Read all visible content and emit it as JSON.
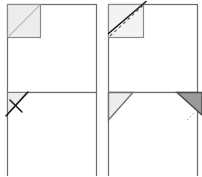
{
  "figure": {
    "layout": "2x2 grid of four line diagrams",
    "canvas": {
      "width": 202,
      "height": 176
    },
    "colors": {
      "sheet_outline": "#6b6b6b",
      "sheet_outline_dark": "#4a4a4a",
      "fold_line_solid": "#1a1a1a",
      "fold_line_dashed": "#555555",
      "shade_light": "#ededed",
      "shade_mid": "#d9d9d9",
      "shade_dark": "#8f8f8f",
      "background": "#ffffff"
    },
    "panels": [
      {
        "id": "panel-1",
        "label": "Step 1",
        "description": "Large sheet with a small shaded square marked in the top-left corner and a faint diagonal crease running corner to corner inside it.",
        "sheet": {
          "x": 7,
          "y": 4,
          "width": 89,
          "height": 88
        },
        "corner_square": {
          "x": 7,
          "y": 4,
          "size": 33,
          "fill": "#ededed",
          "stroke": "#8a8a8a"
        },
        "crease": {
          "type": "diagonal",
          "from": "bottom-left",
          "to": "top-right",
          "style": "solid-faint",
          "color": "#b9b9b9"
        }
      },
      {
        "id": "panel-2",
        "label": "Step 2",
        "description": "Same sheet; the corner square now shows a dashed diagonal crease plus a bold solid fold line lifting from the lower-left of the square past the top-right corner.",
        "sheet": {
          "x": 7,
          "y": 4,
          "width": 89,
          "height": 88
        },
        "corner_square": {
          "x": 7,
          "y": 4,
          "size": 35,
          "fill": "#f3f3f3",
          "stroke": "#8a8a8a"
        },
        "crease_dashed": {
          "from": "bottom-left",
          "to": "top-right",
          "style": "dashed",
          "color": "#5a5a5a",
          "dash": "3 3"
        },
        "fold_solid": {
          "from": "bottom-left",
          "to": "beyond-top-right",
          "style": "solid",
          "color": "#1a1a1a",
          "width": 1.6
        }
      },
      {
        "id": "panel-3",
        "label": "Step 3",
        "description": "Sheet with the top-left corner folded over into a shaded triangle; a short solid stroke crosses the triangle indicating the flap being turned.",
        "sheet": {
          "x": 7,
          "y": 4,
          "width": 89,
          "height": 88
        },
        "folded_triangle": {
          "points": "corner top-left, along top edge, down left edge",
          "fill": "#ededed",
          "stroke": "#7a7a7a"
        },
        "flap_stroke": {
          "from": "lower-left",
          "to": "upper-right",
          "style": "solid",
          "color": "#1a1a1a",
          "width": 1.6
        }
      },
      {
        "id": "panel-4",
        "label": "Step 4",
        "description": "Sheet with a larger shaded triangle folded at the top-left and a matching darker shaded triangle at the top-right corner, clipped by the frame edge.",
        "sheet": {
          "x": 7,
          "y": 4,
          "width": 89,
          "height": 88
        },
        "folded_triangle_left": {
          "fill": "#ededed",
          "stroke": "#6f6f6f"
        },
        "folded_triangle_right": {
          "fill": "#9a9a9a",
          "stroke": "#4a4a4a",
          "clipped": true
        },
        "hint_mark": {
          "style": "dotted",
          "color": "#9a9a9a"
        }
      }
    ]
  }
}
